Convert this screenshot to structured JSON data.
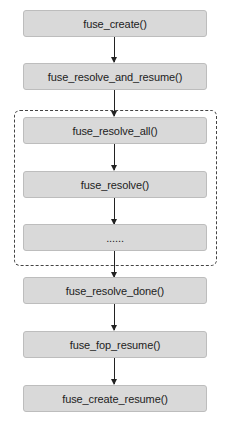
{
  "diagram": {
    "type": "flowchart",
    "nodes": [
      {
        "id": "n1",
        "label": "fuse_create()"
      },
      {
        "id": "n2",
        "label": "fuse_resolve_and_resume()"
      },
      {
        "id": "n3",
        "label": "fuse_resolve_all()"
      },
      {
        "id": "n4",
        "label": "fuse_resolve()"
      },
      {
        "id": "n5",
        "label": "......"
      },
      {
        "id": "n6",
        "label": "fuse_resolve_done()"
      },
      {
        "id": "n7",
        "label": "fuse_fop_resume()"
      },
      {
        "id": "n8",
        "label": "fuse_create_resume()"
      }
    ],
    "edges": [
      [
        "n1",
        "n2"
      ],
      [
        "n2",
        "n3"
      ],
      [
        "n3",
        "n4"
      ],
      [
        "n4",
        "n5"
      ],
      [
        "n5",
        "n6"
      ],
      [
        "n6",
        "n7"
      ],
      [
        "n7",
        "n8"
      ]
    ],
    "groups": [
      {
        "id": "resolve-group",
        "style": "dashed",
        "contains": [
          "n3",
          "n4",
          "n5"
        ]
      }
    ],
    "colors": {
      "node_fill": "#d9d9d9",
      "node_border": "#bdbdbd",
      "arrow": "#222222",
      "group_border": "#444444"
    }
  }
}
